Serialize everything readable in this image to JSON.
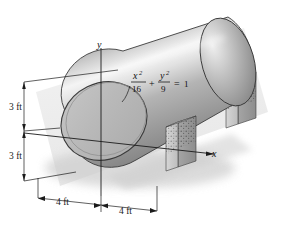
{
  "figure": {
    "background_color": "#ffffff"
  },
  "axes": {
    "y_label": "y",
    "x_label": "x"
  },
  "equation": {
    "numerator_x": "x",
    "numerator_x_exp": "2",
    "denominator_x": "16",
    "operator_plus": "+",
    "numerator_y": "y",
    "numerator_y_exp": "2",
    "denominator_y": "9",
    "operator_equals": "=",
    "right_side": "1",
    "plain": "x^2/16 + y^2/9 = 1"
  },
  "dimensions": {
    "vertical_upper": "3 ft",
    "vertical_lower": "3 ft",
    "horizontal_left": "4 ft",
    "horizontal_right": "4 ft"
  },
  "colors": {
    "tank_light": "#f2f2f2",
    "tank_mid": "#a9a9a9",
    "tank_dark": "#6e6e6e",
    "end_face": "#b6b6b6",
    "support": "#c9c9c9",
    "support_dark": "#8e8e8e",
    "line": "#1b1b1b",
    "shadow": "#d8d8d8"
  }
}
